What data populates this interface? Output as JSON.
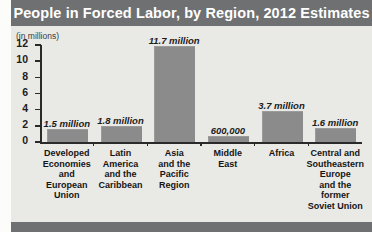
{
  "title": "People in Forced Labor, by Region, 2012 Estimates",
  "axis_unit_note": "(in millions)",
  "colors": {
    "banner": "#6f7072",
    "bar": "#8b8b8b",
    "plot_background": "#e9e9e6",
    "axis": "#2a2a2a",
    "title_text": "#ffffff"
  },
  "chart_data": {
    "type": "bar",
    "title": "People in Forced Labor, by Region, 2012 Estimates",
    "xlabel": "",
    "ylabel": "(in millions)",
    "ylim": [
      0,
      12
    ],
    "yticks": [
      0,
      2,
      4,
      6,
      8,
      10,
      12
    ],
    "ytick_labels": [
      "0",
      "2",
      "4",
      "6",
      "8",
      "10",
      "12"
    ],
    "grid": false,
    "legend": "none",
    "categories": [
      "Developed Economies and European Union",
      "Latin America and the Caribbean",
      "Asia and the Pacific Region",
      "Middle East",
      "Africa",
      "Central and Southeastern Europe and the former Soviet Union"
    ],
    "category_lines": [
      [
        "Developed",
        "Economies",
        "and",
        "European",
        "Union"
      ],
      [
        "Latin",
        "America",
        "and the",
        "Caribbean"
      ],
      [
        "Asia",
        "and the",
        "Pacific",
        "Region"
      ],
      [
        "Middle",
        "East"
      ],
      [
        "Africa"
      ],
      [
        "Central and",
        "Southeastern",
        "Europe",
        "and the",
        "former",
        "Soviet Union"
      ]
    ],
    "values": [
      1.5,
      1.8,
      11.7,
      0.6,
      3.7,
      1.6
    ],
    "data_labels": [
      "1.5 million",
      "1.8 million",
      "11.7 million",
      "600,000",
      "3.7 million",
      "1.6 million"
    ]
  }
}
